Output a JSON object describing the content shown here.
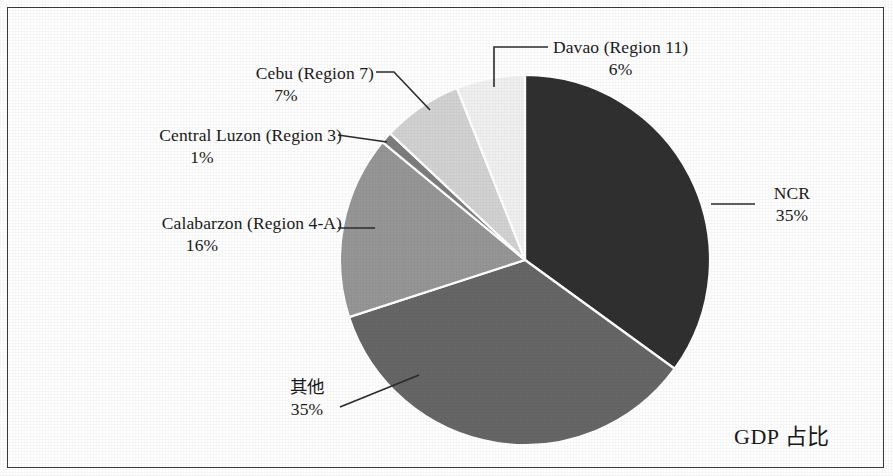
{
  "chart_data": {
    "type": "pie",
    "title": "GDP 占比",
    "title_position": "bottom-right",
    "legend": "none",
    "labels_outside": true,
    "start_angle_deg": 0,
    "direction": "clockwise",
    "categories": [
      "NCR",
      "其他",
      "Calabarzon (Region 4-A)",
      "Central Luzon (Region 3)",
      "Cebu (Region 7)",
      "Davao (Region 11)"
    ],
    "values": [
      35,
      35,
      16,
      1,
      7,
      6
    ],
    "value_labels": [
      "35%",
      "35%",
      "16%",
      "1%",
      "7%",
      "6%"
    ],
    "unit": "%",
    "colors": [
      "#303030",
      "#666666",
      "#969696",
      "#7d7d7d",
      "#d2d2d2",
      "#f0f0f0"
    ],
    "slice_border_color": "#ffffff",
    "slices": [
      {
        "name": "NCR",
        "value": 35,
        "label": "NCR",
        "pct": "35%",
        "color": "#303030"
      },
      {
        "name": "其他",
        "value": 35,
        "label": "其他",
        "pct": "35%",
        "color": "#666666"
      },
      {
        "name": "Calabarzon (Region 4-A)",
        "value": 16,
        "label": "Calabarzon (Region 4-A)",
        "pct": "16%",
        "color": "#969696"
      },
      {
        "name": "Central Luzon (Region 3)",
        "value": 1,
        "label": "Central Luzon (Region 3)",
        "pct": "1%",
        "color": "#7d7d7d"
      },
      {
        "name": "Cebu (Region 7)",
        "value": 7,
        "label": "Cebu (Region 7)",
        "pct": "7%",
        "color": "#d2d2d2"
      },
      {
        "name": "Davao (Region 11)",
        "value": 6,
        "label": "Davao (Region 11)",
        "pct": "6%",
        "color": "#f0f0f0"
      }
    ]
  }
}
